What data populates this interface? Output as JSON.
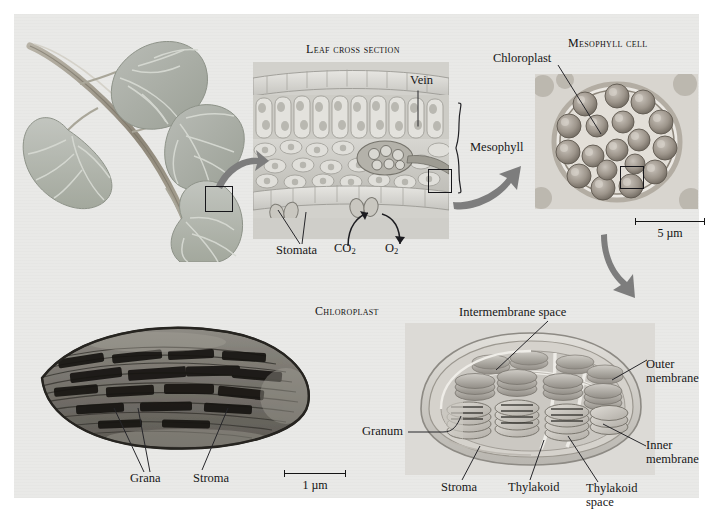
{
  "figure": {
    "background_color": "#e9e9e7",
    "page_color": "#ffffff",
    "ink_color": "#1a1a1a",
    "arrow_color": "#7d7d7d"
  },
  "panels": {
    "leaf_branch": {
      "name": "leaf branch illustration"
    },
    "leaf_cross_section": {
      "title": "Leaf cross section",
      "labels": {
        "vein": "Vein",
        "mesophyll": "Mesophyll",
        "stomata": "Stomata",
        "co2": "CO",
        "co2_sub": "2",
        "o2": "O",
        "o2_sub": "2"
      }
    },
    "mesophyll_cell": {
      "title": "Mesophyll cell",
      "labels": {
        "chloroplast": "Chloroplast"
      },
      "scale_bar": {
        "value": "5",
        "unit": "µm",
        "text": "5 µm"
      }
    },
    "chloroplast_tem": {
      "labels": {
        "grana": "Grana",
        "stroma": "Stroma"
      },
      "scale_bar": {
        "value": "1",
        "unit": "µm",
        "text": "1 µm"
      }
    },
    "chloroplast_diagram": {
      "title": "Chloroplast",
      "labels": {
        "intermembrane_space": "Intermembrane space",
        "outer_membrane": "Outer membrane",
        "inner_membrane": "Inner membrane",
        "granum": "Granum",
        "stroma": "Stroma",
        "thylakoid": "Thylakoid",
        "thylakoid_space": "Thylakoid space"
      }
    }
  }
}
